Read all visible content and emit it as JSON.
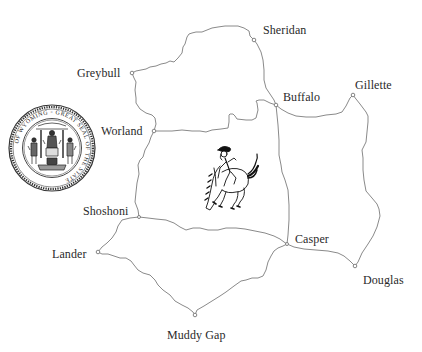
{
  "map": {
    "title": "Wyoming road network",
    "road_color": "#8a8a8a",
    "label_color": "#2a2a2a",
    "background": "#ffffff",
    "cities": [
      {
        "name": "Sheridan",
        "x": 254,
        "y": 40,
        "label_x": 263,
        "label_y": 24
      },
      {
        "name": "Greybull",
        "x": 132,
        "y": 73,
        "label_x": 77,
        "label_y": 67
      },
      {
        "name": "Worland",
        "x": 154,
        "y": 131,
        "label_x": 101,
        "label_y": 125
      },
      {
        "name": "Buffalo",
        "x": 276,
        "y": 105,
        "label_x": 283,
        "label_y": 91
      },
      {
        "name": "Gillette",
        "x": 353,
        "y": 95,
        "label_x": 355,
        "label_y": 79
      },
      {
        "name": "Shoshoni",
        "x": 139,
        "y": 217,
        "label_x": 83,
        "label_y": 205
      },
      {
        "name": "Lander",
        "x": 98,
        "y": 252,
        "label_x": 52,
        "label_y": 248
      },
      {
        "name": "Casper",
        "x": 287,
        "y": 244,
        "label_x": 295,
        "label_y": 233
      },
      {
        "name": "Douglas",
        "x": 355,
        "y": 266,
        "label_x": 363,
        "label_y": 274
      },
      {
        "name": "Muddy Gap",
        "x": 195,
        "y": 315,
        "label_x": 167,
        "label_y": 329
      }
    ],
    "roads": [
      {
        "from": "Greybull",
        "to": "Sheridan"
      },
      {
        "from": "Sheridan",
        "to": "Buffalo"
      },
      {
        "from": "Greybull",
        "to": "Worland"
      },
      {
        "from": "Worland",
        "to": "Buffalo"
      },
      {
        "from": "Buffalo",
        "to": "Gillette"
      },
      {
        "from": "Buffalo",
        "to": "Casper"
      },
      {
        "from": "Gillette",
        "to": "Douglas"
      },
      {
        "from": "Worland",
        "to": "Shoshoni"
      },
      {
        "from": "Shoshoni",
        "to": "Casper"
      },
      {
        "from": "Shoshoni",
        "to": "Lander"
      },
      {
        "from": "Lander",
        "to": "Muddy Gap"
      },
      {
        "from": "Muddy Gap",
        "to": "Casper"
      },
      {
        "from": "Casper",
        "to": "Douglas"
      }
    ]
  },
  "seal": {
    "name": "Great Seal of the State of Wyoming",
    "ring_text": "GREAT SEAL OF THE STATE OF WYOMING",
    "center_x": 52,
    "center_y": 148,
    "radius": 43
  },
  "emblem": {
    "name": "Bucking horse and rider",
    "center_x": 228,
    "center_y": 180
  }
}
